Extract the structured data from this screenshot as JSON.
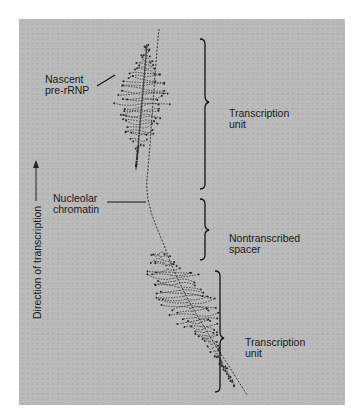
{
  "figure": {
    "type": "electron micrograph",
    "background_color": "#b9b9b9",
    "ink_color": "#1a1a1a"
  },
  "labels": {
    "nascent_pre_rrnp": [
      "Nascent",
      "pre-rRNP"
    ],
    "nucleolar_chromatin": [
      "Nucleolar",
      "chromatin"
    ],
    "transcription_unit_top": [
      "Transcription",
      "unit"
    ],
    "nontranscribed_spacer": [
      "Nontranscribed",
      "spacer"
    ],
    "transcription_unit_bottom": [
      "Transcription",
      "unit"
    ],
    "direction_axis": "Direction of transcription"
  },
  "icons": {
    "direction_arrow": "arrow-up-icon"
  }
}
